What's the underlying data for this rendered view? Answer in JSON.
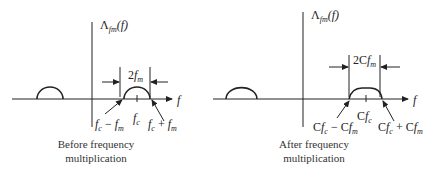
{
  "panels": [
    {
      "id": "before",
      "y_axis_label": {
        "main": "Λ",
        "sub": "fm",
        "arg": "(f)"
      },
      "x_axis_label": "f",
      "bandwidth_label": {
        "prefix": "2",
        "var": "f",
        "sub": "m"
      },
      "center_label": {
        "var": "f",
        "sub": "c"
      },
      "lower_edge_label": "f_c − f_m",
      "upper_edge_label": "f_c + f_m",
      "caption_line1": "Before frequency",
      "caption_line2": "multiplication"
    },
    {
      "id": "after",
      "y_axis_label": {
        "main": "Λ",
        "sub": "fm",
        "arg": "(f)"
      },
      "x_axis_label": "f",
      "bandwidth_label": {
        "prefix": "2C",
        "var": "f",
        "sub": "m"
      },
      "center_label": {
        "prefix": "C",
        "var": "f",
        "sub": "c"
      },
      "lower_edge_label": "Cf_c − Cf_m",
      "upper_edge_label": "Cf_c + Cf_m",
      "caption_line1": "After frequency",
      "caption_line2": "multiplication"
    }
  ],
  "colors": {
    "stroke": "#222222",
    "background": "#ffffff"
  }
}
